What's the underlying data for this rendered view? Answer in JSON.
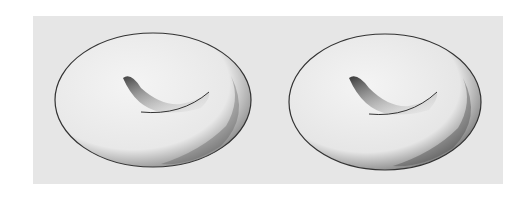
{
  "figure": {
    "panel_color": "#e6e6e6",
    "stroke_color": "#333333",
    "items": [
      {
        "name": "torus-left",
        "shading": "hatched"
      },
      {
        "name": "torus-right",
        "shading": "stippled"
      }
    ]
  }
}
